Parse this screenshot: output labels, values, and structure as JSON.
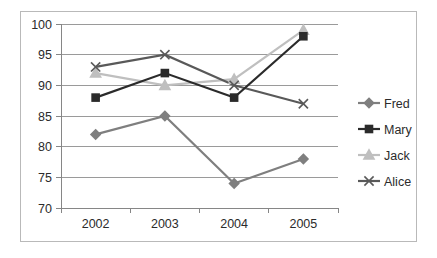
{
  "chart_data": {
    "type": "line",
    "title": "",
    "subtitle": "",
    "xlabel": "",
    "ylabel": "",
    "categories": [
      "2002",
      "2003",
      "2004",
      "2005"
    ],
    "ylim": [
      70,
      100
    ],
    "yticks": [
      70,
      75,
      80,
      85,
      90,
      95,
      100
    ],
    "ytick_labels": [
      "70",
      "75",
      "80",
      "85",
      "90",
      "95",
      "100"
    ],
    "grid": "horizontal",
    "legend_position": "right",
    "series": [
      {
        "name": "Fred",
        "values": [
          82,
          85,
          74,
          78
        ],
        "color": "#7f7f7f",
        "marker": "diamond"
      },
      {
        "name": "Mary",
        "values": [
          88,
          92,
          88,
          98
        ],
        "color": "#2b2b2b",
        "marker": "square"
      },
      {
        "name": "Jack",
        "values": [
          92,
          90,
          91,
          99
        ],
        "color": "#bfbfbf",
        "marker": "triangle"
      },
      {
        "name": "Alice",
        "values": [
          93,
          95,
          90,
          87
        ],
        "color": "#595959",
        "marker": "x"
      }
    ]
  },
  "legend": {
    "items": [
      {
        "label": "Fred"
      },
      {
        "label": "Mary"
      },
      {
        "label": "Jack"
      },
      {
        "label": "Alice"
      }
    ]
  },
  "axes": {
    "y_labels": [
      "100",
      "95",
      "90",
      "85",
      "80",
      "75",
      "70"
    ],
    "x_labels": [
      "2002",
      "2003",
      "2004",
      "2005"
    ]
  },
  "style": {
    "border_color": "#b9b9b9",
    "gridline_color": "#9a9a9a",
    "axis_color": "#868686",
    "text_color": "#2b2b2b",
    "background": "#ffffff"
  }
}
